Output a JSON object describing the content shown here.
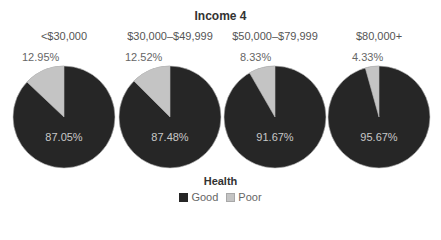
{
  "chart_data": {
    "type": "pie",
    "title": "Income 4",
    "legend": {
      "title": "Health",
      "position": "bottom",
      "entries": [
        {
          "label": "Good",
          "color": "#262626"
        },
        {
          "label": "Poor",
          "color": "#c4c4c4"
        }
      ]
    },
    "categories": [
      "<$30,000",
      "$30,000–$49,999",
      "$50,000–$79,999",
      "$80,000+"
    ],
    "series": [
      {
        "name": "Good",
        "values": [
          87.05,
          87.48,
          91.67,
          95.67
        ]
      },
      {
        "name": "Poor",
        "values": [
          12.95,
          12.52,
          8.33,
          4.33
        ]
      }
    ],
    "pies": [
      {
        "category": "<$30,000",
        "good": 87.05,
        "poor": 12.95,
        "good_label": "87.05%",
        "poor_label": "12.95%"
      },
      {
        "category": "$30,000–$49,999",
        "good": 87.48,
        "poor": 12.52,
        "good_label": "87.48%",
        "poor_label": "12.52%"
      },
      {
        "category": "$50,000–$79,999",
        "good": 91.67,
        "poor": 8.33,
        "good_label": "91.67%",
        "poor_label": "8.33%"
      },
      {
        "category": "$80,000+",
        "good": 95.67,
        "poor": 4.33,
        "good_label": "95.67%",
        "poor_label": "4.33%"
      }
    ]
  }
}
